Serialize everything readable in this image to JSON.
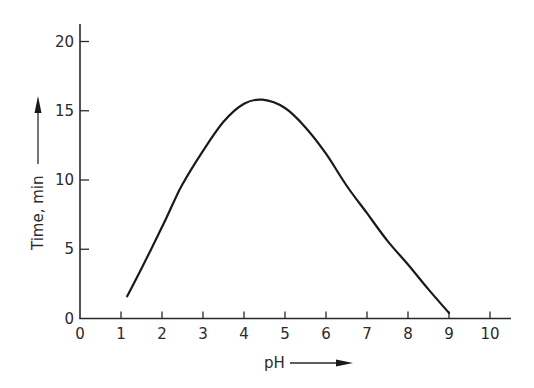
{
  "chart_data": {
    "type": "line",
    "title": "",
    "xlabel": "pH",
    "ylabel": "Time, min",
    "xlim": [
      0,
      10.5
    ],
    "ylim": [
      0,
      21
    ],
    "x_ticks": [
      0,
      1,
      2,
      3,
      4,
      5,
      6,
      7,
      8,
      9,
      10
    ],
    "y_ticks": [
      0,
      5,
      10,
      15,
      20
    ],
    "grid": false,
    "legend": null,
    "series": [
      {
        "name": "Time vs pH",
        "x": [
          1.15,
          1.5,
          2.0,
          2.3,
          2.5,
          3.0,
          3.5,
          4.0,
          4.45,
          5.0,
          5.5,
          6.0,
          6.5,
          7.0,
          7.5,
          8.0,
          8.5,
          9.0
        ],
        "y": [
          1.6,
          3.6,
          6.6,
          8.5,
          9.7,
          12.1,
          14.2,
          15.5,
          15.8,
          15.2,
          13.8,
          11.9,
          9.6,
          7.6,
          5.6,
          3.9,
          2.1,
          0.4
        ]
      }
    ]
  },
  "labels": {
    "x_axis_title": "pH",
    "y_axis_title": "Time, min"
  },
  "colors": {
    "line": "#1a1a1a",
    "axis": "#2a2a2a",
    "text": "#2a2a2a"
  }
}
